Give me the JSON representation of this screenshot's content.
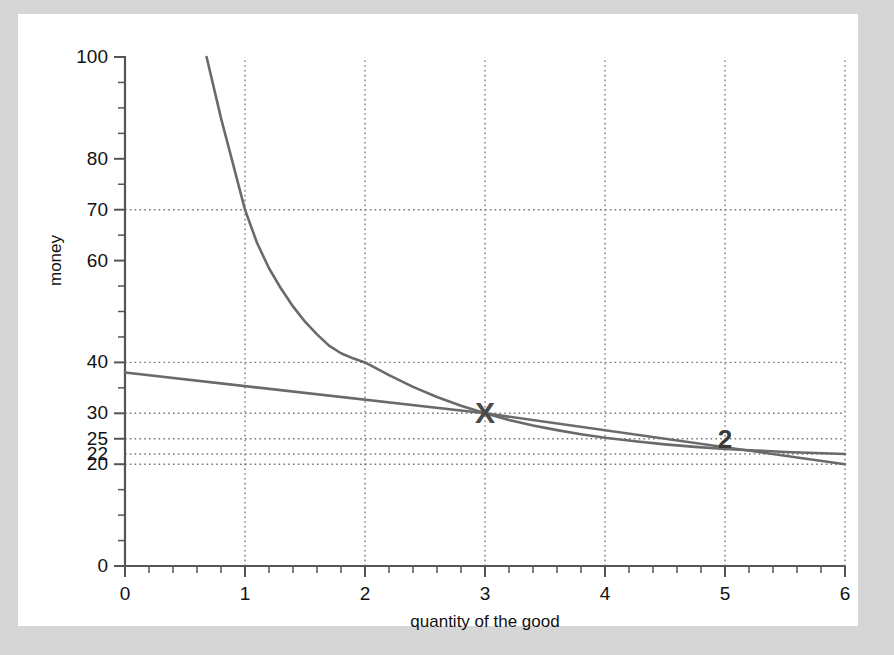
{
  "figure": {
    "background_color": "#d6d6d6",
    "paper_color": "#ffffff",
    "curve_color": "#6a6a6a",
    "axis_color": "#555555",
    "grid_color": "#777777",
    "text_color": "#111111"
  },
  "chart_data": {
    "type": "line",
    "title": "",
    "xlabel": "quantity of the good",
    "ylabel": "money",
    "xlim": [
      0,
      6
    ],
    "ylim": [
      0,
      100
    ],
    "grid": true,
    "grid_style": "dotted",
    "legend": "none",
    "x_ticks": [
      0,
      1,
      2,
      3,
      4,
      5,
      6
    ],
    "x_tick_labels": [
      "0",
      "1",
      "2",
      "3",
      "4",
      "5",
      "6"
    ],
    "x_minor_tick_step": 0.2,
    "y_ticks": [
      0,
      20,
      22,
      25,
      30,
      40,
      60,
      70,
      80,
      100
    ],
    "y_tick_labels": [
      "0",
      "20",
      "22",
      "25",
      "30",
      "40",
      "60",
      "70",
      "80",
      "100"
    ],
    "y_minor_tick_step": 5,
    "y_gridline_values": [
      20,
      22,
      25,
      30,
      40,
      70
    ],
    "x_gridline_values": [
      1,
      2,
      3,
      4,
      5,
      6
    ],
    "series": [
      {
        "name": "indifference-curve",
        "type": "curve",
        "style": "solid",
        "points": [
          [
            0.68,
            100.0
          ],
          [
            0.75,
            93.0
          ],
          [
            0.8,
            88.0
          ],
          [
            0.85,
            83.5
          ],
          [
            0.9,
            79.0
          ],
          [
            0.95,
            74.5
          ],
          [
            1.0,
            70.0
          ],
          [
            1.1,
            63.5
          ],
          [
            1.2,
            58.5
          ],
          [
            1.3,
            54.5
          ],
          [
            1.4,
            51.0
          ],
          [
            1.5,
            48.0
          ],
          [
            1.6,
            45.5
          ],
          [
            1.7,
            43.3
          ],
          [
            1.8,
            41.8
          ],
          [
            1.9,
            40.8
          ],
          [
            2.0,
            40.0
          ],
          [
            2.2,
            37.5
          ],
          [
            2.4,
            35.2
          ],
          [
            2.6,
            33.2
          ],
          [
            2.8,
            31.5
          ],
          [
            3.0,
            30.0
          ],
          [
            3.2,
            28.7
          ],
          [
            3.4,
            27.6
          ],
          [
            3.6,
            26.7
          ],
          [
            3.8,
            25.9
          ],
          [
            4.0,
            25.2
          ],
          [
            4.25,
            24.5
          ],
          [
            4.5,
            23.9
          ],
          [
            4.75,
            23.4
          ],
          [
            5.0,
            23.0
          ],
          [
            5.25,
            22.7
          ],
          [
            5.5,
            22.4
          ],
          [
            5.75,
            22.2
          ],
          [
            6.0,
            22.0
          ]
        ]
      },
      {
        "name": "budget-line",
        "type": "line",
        "style": "solid",
        "points": [
          [
            0.0,
            38.0
          ],
          [
            3.0,
            30.0
          ],
          [
            6.0,
            20.0
          ]
        ]
      }
    ],
    "annotations": [
      {
        "name": "intersection-marker",
        "text": "X",
        "x": 3.0,
        "y": 30.0
      },
      {
        "name": "curve-label-2",
        "text": "2",
        "x": 5.0,
        "y": 25.0
      }
    ]
  }
}
